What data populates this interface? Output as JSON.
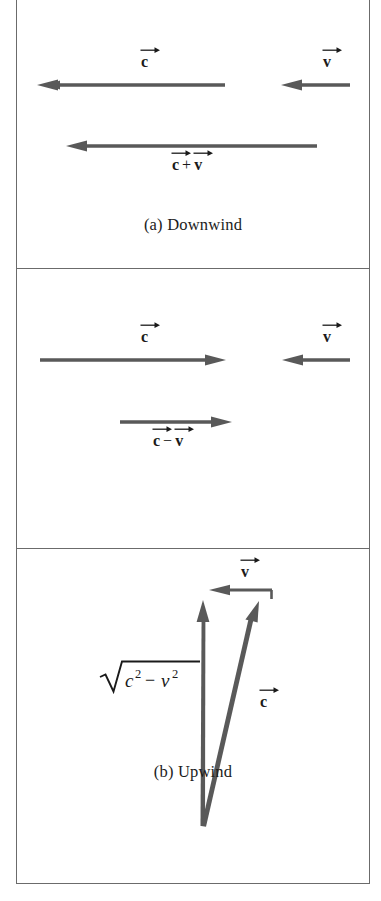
{
  "figure": {
    "type": "vector-diagram-figure",
    "panel_count": 3,
    "arrow_color": "#595959",
    "border_color": "#6b6b6b",
    "background": "#ffffff"
  },
  "panels": [
    {
      "id": "a",
      "caption": "(a) Downwind",
      "labels": {
        "c": "c",
        "v": "v",
        "sum_left": "c",
        "sum_op": "+",
        "sum_right": "v"
      },
      "arrows": [
        {
          "name": "c-vector",
          "direction": "left",
          "x1": 225,
          "y1": 85,
          "x2": 37,
          "y2": 85
        },
        {
          "name": "v-vector",
          "direction": "left",
          "x1": 350,
          "y1": 85,
          "x2": 281,
          "y2": 85
        },
        {
          "name": "c-plus-v-vector",
          "direction": "left",
          "x1": 317,
          "y1": 146,
          "x2": 66,
          "y2": 146
        }
      ]
    },
    {
      "id": "b",
      "caption": "(b) Upwind",
      "labels": {
        "c": "c",
        "v": "v",
        "diff_left": "c",
        "diff_op": "−",
        "diff_right": "v"
      },
      "arrows": [
        {
          "name": "c-vector",
          "direction": "right",
          "x1": 40,
          "y1": 360,
          "x2": 226,
          "y2": 360
        },
        {
          "name": "v-vector",
          "direction": "left",
          "x1": 350,
          "y1": 360,
          "x2": 282,
          "y2": 360
        },
        {
          "name": "c-minus-v-vector",
          "direction": "right",
          "x1": 120,
          "y1": 422,
          "x2": 232,
          "y2": 422
        }
      ]
    },
    {
      "id": "c",
      "caption": "(c) Across wind",
      "labels": {
        "v": "v",
        "c": "c",
        "sqrt_radicand_terms": [
          "c",
          "2",
          "−",
          "v",
          "2"
        ],
        "sqrt_text": "√(c² − v²)"
      },
      "arrows": [
        {
          "name": "resultant-vector",
          "direction": "up",
          "x1": 203,
          "y1": 826,
          "x2": 203,
          "y2": 600
        },
        {
          "name": "v-vector",
          "direction": "left",
          "x1": 272,
          "y1": 590,
          "x2": 209,
          "y2": 590
        },
        {
          "name": "c-vector",
          "direction": "up-right",
          "x1": 203,
          "y1": 826,
          "x2": 259,
          "y2": 601
        }
      ]
    }
  ]
}
